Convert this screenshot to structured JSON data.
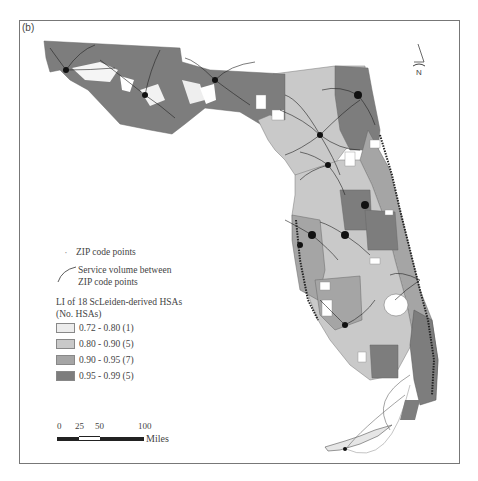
{
  "figure": {
    "panel_label": "(b)"
  },
  "legend": {
    "points_label": "ZIP code points",
    "lines_label_1": "Service volume between",
    "lines_label_2": "ZIP code points",
    "title_1": "LI of 18 ScLeiden-derived HSAs",
    "title_2": "(No. HSAs)",
    "classes": [
      {
        "label": "0.72 - 0.80 (1)",
        "color": "#ececec"
      },
      {
        "label": "0.80 - 0.90 (5)",
        "color": "#c9c9c9"
      },
      {
        "label": "0.90 - 0.95 (7)",
        "color": "#a5a5a5"
      },
      {
        "label": "0.95 - 0.99 (5)",
        "color": "#7d7d7d"
      }
    ]
  },
  "scale_bar": {
    "ticks": [
      "0",
      "25",
      "50",
      "100"
    ],
    "unit": "Miles"
  },
  "north_arrow": {
    "label": "N"
  },
  "colors": {
    "class1": "#ececec",
    "class2": "#c9c9c9",
    "class3": "#a5a5a5",
    "class4": "#7d7d7d",
    "lines": "#222222"
  }
}
